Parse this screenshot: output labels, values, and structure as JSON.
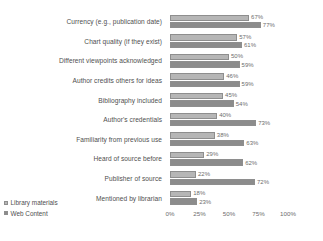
{
  "chart_data": {
    "type": "bar",
    "orientation": "horizontal",
    "title": "",
    "xlabel": "",
    "ylabel": "",
    "xlim": [
      0,
      100
    ],
    "xticks": [
      "0%",
      "25%",
      "50%",
      "75%",
      "100%"
    ],
    "grid": false,
    "legend_position": "bottom-left",
    "categories": [
      "Currency (e.g., publication date)",
      "Chart quality (if they exist)",
      "Different viewpoints acknowledged",
      "Author credits others for ideas",
      "Bibliography included",
      "Author's credentials",
      "Familiarity from previous use",
      "Heard of source before",
      "Publisher of source",
      "Mentioned by librarian"
    ],
    "series": [
      {
        "name": "Library materials",
        "color": "#b6b6b6",
        "values": [
          67,
          57,
          50,
          46,
          45,
          40,
          38,
          29,
          22,
          18
        ],
        "labels": [
          "67%",
          "57%",
          "50%",
          "46%",
          "45%",
          "40%",
          "38%",
          "29%",
          "22%",
          "18%"
        ]
      },
      {
        "name": "Web Content",
        "color": "#8c8c8c",
        "values": [
          77,
          61,
          59,
          59,
          54,
          73,
          63,
          62,
          72,
          23
        ],
        "labels": [
          "77%",
          "61%",
          "59%",
          "59%",
          "54%",
          "73%",
          "63%",
          "62%",
          "72%",
          "23%"
        ]
      }
    ]
  }
}
